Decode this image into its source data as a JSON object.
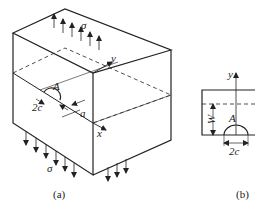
{
  "figure_a": {
    "caption": "(a)",
    "labels": {
      "stress_top": "σ",
      "stress_bottom": "σ",
      "point": "A",
      "crack_width": "2c",
      "crack_depth": "a",
      "axis_x": "x",
      "axis_y": "y"
    }
  },
  "figure_b": {
    "caption": "(b)",
    "labels": {
      "axis_y": "y",
      "point": "A",
      "thickness": "W",
      "crack_width": "2c"
    }
  },
  "colors": {
    "line": "#222222",
    "background": "#ffffff"
  }
}
